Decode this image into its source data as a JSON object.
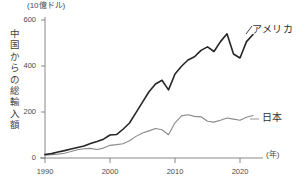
{
  "chart_data": {
    "type": "line",
    "title": "",
    "unit_note": "(10億ドル)",
    "ylabel": "中国からの総輸入額",
    "xlabel": "(年)",
    "grid": false,
    "legend_position": "inline-right",
    "xlim": [
      1989,
      2023
    ],
    "ylim": [
      0,
      640
    ],
    "xticks": [
      1990,
      2000,
      2010,
      2020
    ],
    "xtick_labels": [
      "1990",
      "2000",
      "2010",
      "2020"
    ],
    "yticks": [
      0,
      200,
      400,
      600
    ],
    "ytick_labels": [
      "0",
      "200",
      "400",
      "600"
    ],
    "series": [
      {
        "name": "アメリカ",
        "color": "#262626",
        "width": 1.6,
        "x": [
          1990,
          1991,
          1992,
          1993,
          1994,
          1995,
          1996,
          1997,
          1998,
          1999,
          2000,
          2001,
          2002,
          2003,
          2004,
          2005,
          2006,
          2007,
          2008,
          2009,
          2010,
          2011,
          2012,
          2013,
          2014,
          2015,
          2016,
          2017,
          2018,
          2019,
          2020,
          2021,
          2022
        ],
        "values": [
          15,
          19,
          26,
          32,
          39,
          46,
          52,
          63,
          72,
          82,
          100,
          102,
          125,
          152,
          197,
          243,
          288,
          322,
          338,
          296,
          365,
          399,
          426,
          440,
          468,
          483,
          463,
          506,
          540,
          452,
          435,
          506,
          537
        ]
      },
      {
        "name": "日本",
        "color": "#8a8a8a",
        "width": 1.1,
        "x": [
          1990,
          1991,
          1992,
          1993,
          1994,
          1995,
          1996,
          1997,
          1998,
          1999,
          2000,
          2001,
          2002,
          2003,
          2004,
          2005,
          2006,
          2007,
          2008,
          2009,
          2010,
          2011,
          2012,
          2013,
          2014,
          2015,
          2016,
          2017,
          2018,
          2019,
          2020,
          2021,
          2022
        ],
        "values": [
          12,
          14,
          17,
          21,
          28,
          36,
          40,
          42,
          37,
          43,
          55,
          58,
          62,
          75,
          94,
          109,
          118,
          128,
          123,
          101,
          153,
          183,
          188,
          181,
          179,
          160,
          156,
          164,
          174,
          169,
          164,
          177,
          185
        ]
      }
    ],
    "annotations": [
      {
        "text": "アメリカ",
        "series": "アメリカ"
      },
      {
        "text": "日本",
        "series": "日本"
      }
    ]
  },
  "axes": {
    "unit_note": "(10億ドル)",
    "ylabel": "中国からの総輸入額",
    "xlabel": "(年)",
    "ytick_labels": [
      "600",
      "400",
      "200",
      "0"
    ],
    "xtick_labels": [
      "1990",
      "2000",
      "2010",
      "2020"
    ]
  },
  "legend": {
    "america": "アメリカ",
    "japan": "日本"
  },
  "colors": {
    "america_line": "#262626",
    "japan_line": "#8a8a8a",
    "axis": "#6b6b6b",
    "text": "#3a3a3a",
    "background": "#ffffff"
  }
}
